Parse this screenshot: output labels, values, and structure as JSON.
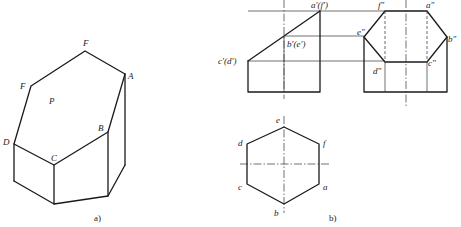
{
  "figure": {
    "colors": {
      "line": "#1a1a1a",
      "background": "#ffffff",
      "text": "#222222"
    },
    "part_a": {
      "caption": "a)",
      "labels": {
        "F_top": "F",
        "A": "A",
        "F_left": "F",
        "P": "P",
        "D": "D",
        "B": "B",
        "C": "C"
      }
    },
    "part_b": {
      "caption": "b)",
      "front_view": {
        "labels": {
          "a_f": "a′(f′)",
          "b_e": "b′(e′)",
          "c_d": "c′(d′)"
        }
      },
      "side_view": {
        "labels": {
          "f": "f″",
          "a": "a″",
          "e": "e″",
          "b": "b″",
          "d": "d″",
          "c": "c″"
        }
      },
      "top_view": {
        "labels": {
          "e": "e",
          "d": "d",
          "f": "f",
          "c": "c",
          "a": "a",
          "b": "b"
        }
      }
    }
  }
}
